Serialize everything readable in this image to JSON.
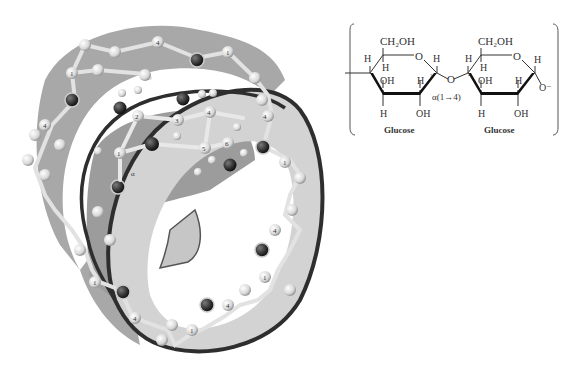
{
  "figure": {
    "colors": {
      "ribbon_outer": "#a9a9a9",
      "ribbon_inner": "#d2d2d2",
      "ribbon_edge": "#2e2e2e",
      "atom_carbon": "#e6e6e6",
      "atom_oxygen": "#3a3a3a",
      "bond": "#dcdcdc"
    }
  },
  "helix": {
    "central_residue_labels": {
      "c1": "1",
      "c2": "2",
      "c3": "3",
      "c4": "4",
      "c5": "5",
      "c6": "6",
      "ring_oxygen": "O",
      "anomeric": "α",
      "hydrogen": "H"
    },
    "ring_labels": [
      "4",
      "1",
      "4",
      "1",
      "4",
      "1",
      "4",
      "1",
      "4",
      "1",
      "4",
      "1"
    ]
  },
  "structure": {
    "left_residue": {
      "ch2oh": "CH₂OH",
      "ring_o": "O",
      "labels": {
        "h_tl": "H",
        "h_tr": "H",
        "h_c4": "H",
        "oh_c3": "OH",
        "h_c2": "H",
        "h_bottom": "H",
        "oh_bottom": "OH",
        "c1_num": "1"
      },
      "name": "Glucose"
    },
    "right_residue": {
      "ch2oh": "CH₂OH",
      "ring_o": "O",
      "labels": {
        "h_tl": "H",
        "h_tr": "H",
        "h_c4": "H",
        "oh_c3": "OH",
        "h_c2": "H",
        "h_bottom": "H",
        "oh_bottom": "OH",
        "c4_num": "4",
        "o_minus": "O⁻"
      },
      "name": "Glucose"
    },
    "glycosidic_o": "O",
    "linkage": "α(1→4)"
  }
}
